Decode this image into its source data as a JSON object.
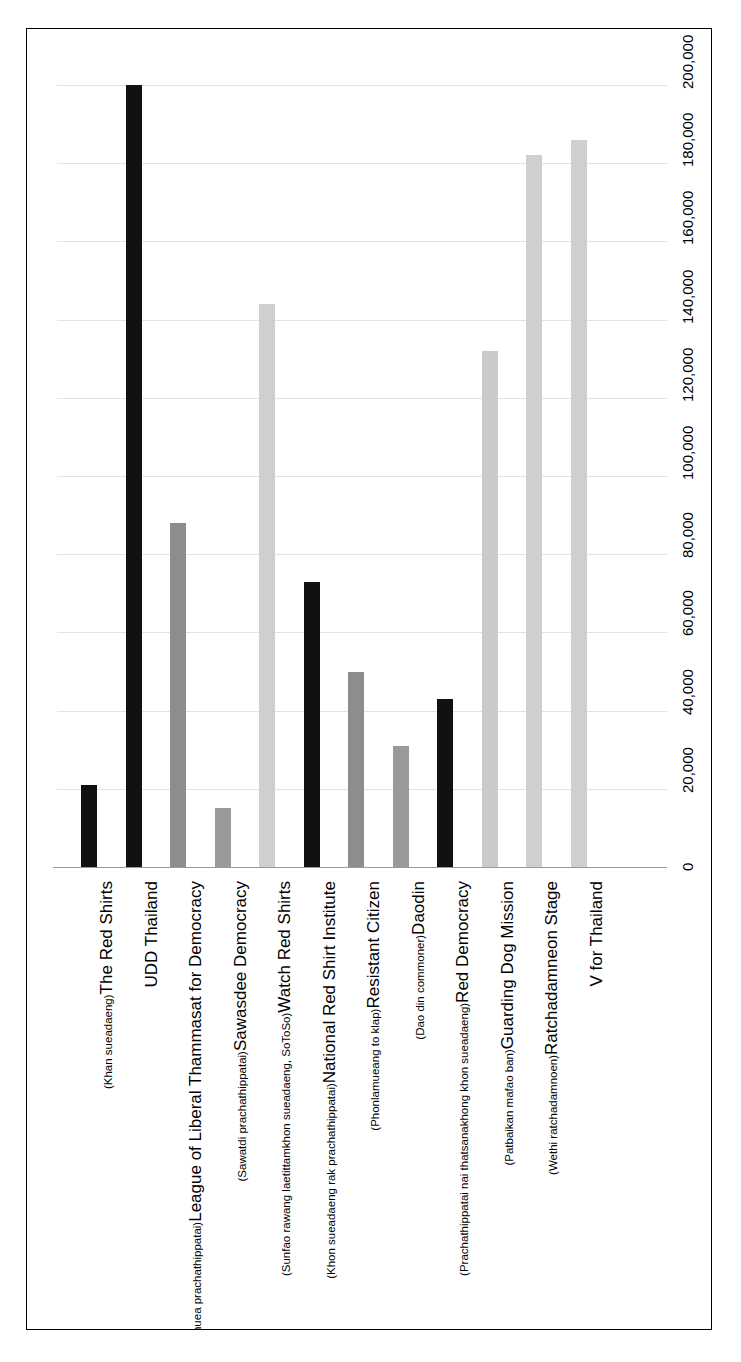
{
  "figure": {
    "frame": true,
    "background": "#ffffff"
  },
  "chart_data": {
    "type": "bar",
    "orientation": "vertical-rendered-rotated",
    "title": "",
    "subtitle": "",
    "xlabel": "",
    "ylabel": "",
    "grid": true,
    "legend": "none",
    "ylim": [
      0,
      200000
    ],
    "tick_labels": [
      "0",
      "20,000",
      "40,000",
      "60,000",
      "80,000",
      "100,000",
      "120,000",
      "140,000",
      "160,000",
      "180,000",
      "200,000"
    ],
    "tick_values": [
      0,
      20000,
      40000,
      60000,
      80000,
      100000,
      120000,
      140000,
      160000,
      180000,
      200000
    ],
    "categories": [
      "The Red Shirts",
      "UDD Thailand",
      "League of Liberal Thammasat for Democracy",
      "Sawasdee Democracy",
      "Watch Red Shirts",
      "National Red Shirt Institute",
      "Resistant Citizen",
      "Daodin",
      "Red Democracy",
      "Guarding Dog Mission",
      "Ratchadamneon Stage",
      "V for Thailand"
    ],
    "category_subtitles": [
      "(Khan sueadaeng)",
      "",
      "(Klum thammasat seri phuea prachathippatai)",
      "(Sawatdi prachathippatai)",
      "(Sunfao rawang laetittamkhon sueadaeng, SoToSo)",
      "(Khon sueadaeng rak prachathippatai)",
      "(Phonlamueang to klap)",
      "(Dao din commoner)",
      "(Prachathippatai nai thatsanakhong khon sueadaeng)",
      "(Patbaikan mafao ban)",
      "(Wethi ratchadamnoen)",
      ""
    ],
    "values": [
      21000,
      200000,
      88000,
      15000,
      144000,
      73000,
      50000,
      31000,
      43000,
      132000,
      182000,
      186000
    ],
    "bar_colors": [
      "#111111",
      "#111111",
      "#8d8d8d",
      "#9a9a9a",
      "#cfcfcf",
      "#111111",
      "#8d8d8d",
      "#9a9a9a",
      "#111111",
      "#cacaca",
      "#cfcfcf",
      "#cfcfcf"
    ],
    "colors": {
      "grid": "#e2e2e2",
      "axis": "#9a9a9a",
      "frame": "#000000",
      "background": "#ffffff",
      "dark": "#111111",
      "mid": "#8d8d8d",
      "light": "#cfcfcf"
    }
  }
}
